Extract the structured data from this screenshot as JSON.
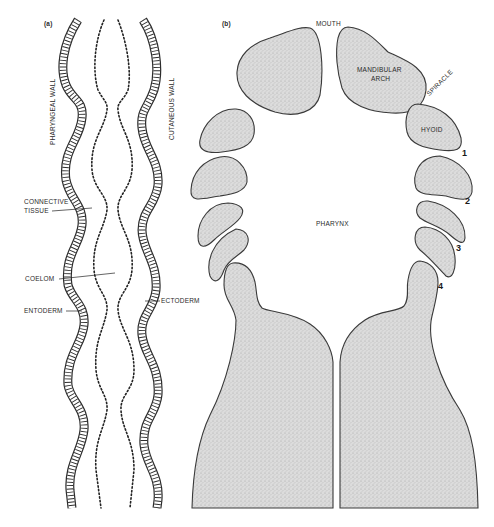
{
  "figure": {
    "panel_a": {
      "label": "(a)",
      "labels": {
        "pharyngeal_wall": "PHARYNGEAL WALL",
        "cutaneous_wall": "CUTANEOUS WALL",
        "connective_tissue_line1": "CONNECTIVE",
        "connective_tissue_line2": "TISSUE",
        "coelom": "COELOM",
        "entoderm": "ENTODERM",
        "ectoderm": "ECTODERM"
      }
    },
    "panel_b": {
      "label": "(b)",
      "labels": {
        "mouth": "MOUTH",
        "mandibular_line1": "MANDIBULAR",
        "mandibular_line2": "ARCH",
        "spiracle": "SPIRACLE",
        "hyoid": "HYOID",
        "pharynx": "PHARYNX"
      },
      "gill_slits": [
        "1",
        "2",
        "3",
        "4"
      ]
    },
    "colors": {
      "stipple_fill": "#d6d6d6",
      "outline": "#3a3a3a",
      "background": "#ffffff"
    }
  }
}
